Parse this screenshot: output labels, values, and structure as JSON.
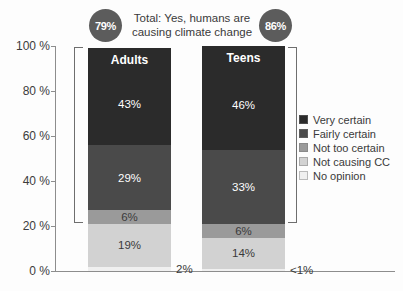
{
  "header": {
    "total_caption": "Total: Yes, humans are causing climate change",
    "adults_total": "79%",
    "teens_total": "86%",
    "circle_color": "#5c5c5c"
  },
  "axis": {
    "y_ticks": [
      "100 %",
      "80 %",
      "60 %",
      "40 %",
      "20 %",
      "0 %"
    ],
    "y_values": [
      100,
      80,
      60,
      40,
      20,
      0
    ],
    "axis_color": "#8d8d8d"
  },
  "legend": {
    "items": [
      {
        "label": "Very certain",
        "color": "#2b2b2b"
      },
      {
        "label": "Fairly certain",
        "color": "#4a4a4a"
      },
      {
        "label": "Not too certain",
        "color": "#9a9a9a"
      },
      {
        "label": "Not causing CC",
        "color": "#d2d2d2"
      },
      {
        "label": "No opinion",
        "color": "#f0f0f0"
      }
    ]
  },
  "bars": {
    "adults": {
      "title": "Adults",
      "segments": [
        {
          "category": "Very certain",
          "label": "43%",
          "value": 43,
          "color": "#2b2b2b",
          "text": "light",
          "outside": false
        },
        {
          "category": "Fairly certain",
          "label": "29%",
          "value": 29,
          "color": "#4a4a4a",
          "text": "light",
          "outside": false
        },
        {
          "category": "Not too certain",
          "label": "6%",
          "value": 6,
          "color": "#9a9a9a",
          "text": "dark",
          "outside": false
        },
        {
          "category": "Not causing CC",
          "label": "19%",
          "value": 19,
          "color": "#d2d2d2",
          "text": "dark",
          "outside": false
        },
        {
          "category": "No opinion",
          "label": "2%",
          "value": 2,
          "color": "#f0f0f0",
          "text": "dark",
          "outside": true
        }
      ]
    },
    "teens": {
      "title": "Teens",
      "segments": [
        {
          "category": "Very certain",
          "label": "46%",
          "value": 46,
          "color": "#2b2b2b",
          "text": "light",
          "outside": false
        },
        {
          "category": "Fairly certain",
          "label": "33%",
          "value": 33,
          "color": "#4a4a4a",
          "text": "light",
          "outside": false
        },
        {
          "category": "Not too certain",
          "label": "6%",
          "value": 6,
          "color": "#9a9a9a",
          "text": "dark",
          "outside": false
        },
        {
          "category": "Not causing CC",
          "label": "14%",
          "value": 14,
          "color": "#d2d2d2",
          "text": "dark",
          "outside": false
        },
        {
          "category": "No opinion",
          "label": "<1%",
          "value": 0.8,
          "color": "#f0f0f0",
          "text": "dark",
          "outside": true
        }
      ]
    }
  },
  "chart_data": {
    "type": "bar",
    "title": "Total: Yes, humans are causing climate change",
    "subtitle": "",
    "xlabel": "",
    "ylabel": "",
    "ylim": [
      0,
      100
    ],
    "grid": false,
    "stacked": true,
    "legend_position": "right",
    "categories": [
      "Adults",
      "Teens"
    ],
    "series": [
      {
        "name": "Very certain",
        "values": [
          43,
          46
        ],
        "labels": [
          "43%",
          "46%"
        ],
        "color": "#2b2b2b"
      },
      {
        "name": "Fairly certain",
        "values": [
          29,
          33
        ],
        "labels": [
          "29%",
          "33%"
        ],
        "color": "#4a4a4a"
      },
      {
        "name": "Not too certain",
        "values": [
          6,
          6
        ],
        "labels": [
          "6%",
          "6%"
        ],
        "color": "#9a9a9a"
      },
      {
        "name": "Not causing CC",
        "values": [
          19,
          14
        ],
        "labels": [
          "19%",
          "14%"
        ],
        "color": "#d2d2d2"
      },
      {
        "name": "No opinion",
        "values": [
          2,
          0.8
        ],
        "labels": [
          "2%",
          "<1%"
        ],
        "color": "#f0f0f0"
      }
    ],
    "annotations": [
      {
        "text": "79%",
        "target": "Adults",
        "meaning": "Total: Yes, humans are causing climate change"
      },
      {
        "text": "86%",
        "target": "Teens",
        "meaning": "Total: Yes, humans are causing climate change"
      }
    ],
    "yticks": [
      0,
      20,
      40,
      60,
      80,
      100
    ],
    "yticklabels": [
      "0 %",
      "20 %",
      "40 %",
      "60 %",
      "80 %",
      "100 %"
    ]
  }
}
